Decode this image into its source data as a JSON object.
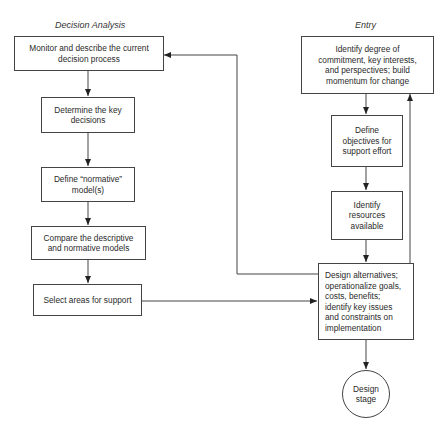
{
  "diagram": {
    "columns": {
      "left": {
        "heading": "Decision Analysis",
        "nodes": [
          {
            "id": "monitor",
            "label": "Monitor and describe the current\ndecision process"
          },
          {
            "id": "determine",
            "label": "Determine the key\ndecisions"
          },
          {
            "id": "define_normative",
            "label": "Define “normative”\nmodel(s)"
          },
          {
            "id": "compare",
            "label": "Compare the descriptive\nand normative models"
          },
          {
            "id": "select",
            "label": "Select areas for support"
          }
        ]
      },
      "right": {
        "heading": "Entry",
        "nodes": [
          {
            "id": "identify_degree",
            "label": "Identify degree of\ncommitment, key interests,\nand perspectives; build\nmomentum for change"
          },
          {
            "id": "define_objectives",
            "label": "Define\nobjectives for\nsupport effort"
          },
          {
            "id": "identify_resources",
            "label": "Identify\nresources\navailable"
          },
          {
            "id": "design_alternatives",
            "label": "Design alternatives;\noperationalize goals,\ncosts, benefits;\nidentify key issues\nand constraints on\nimplementation"
          },
          {
            "id": "design_stage",
            "label": "Design\nstage",
            "shape": "circle"
          }
        ]
      }
    },
    "edges": [
      {
        "from": "monitor",
        "to": "determine"
      },
      {
        "from": "determine",
        "to": "define_normative"
      },
      {
        "from": "define_normative",
        "to": "compare"
      },
      {
        "from": "compare",
        "to": "select"
      },
      {
        "from": "select",
        "to": "design_alternatives"
      },
      {
        "from": "identify_degree",
        "to": "define_objectives"
      },
      {
        "from": "define_objectives",
        "to": "identify_resources"
      },
      {
        "from": "identify_resources",
        "to": "design_alternatives"
      },
      {
        "from": "design_alternatives",
        "to": "design_stage"
      },
      {
        "from": "design_alternatives",
        "to": "monitor",
        "type": "feedback"
      },
      {
        "from": "design_alternatives",
        "to": "identify_degree",
        "type": "feedback"
      }
    ]
  }
}
